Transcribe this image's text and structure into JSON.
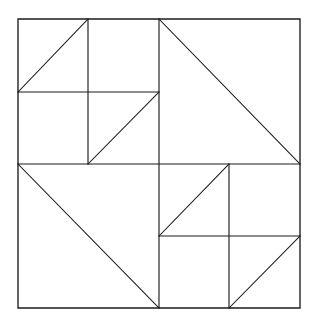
{
  "figure": {
    "type": "line-diagram",
    "background_color": "#ffffff",
    "line_color": "#1c1c1c",
    "canvas": {
      "width": 317,
      "height": 323
    },
    "square": {
      "x0": 18,
      "y0": 19,
      "x1": 300,
      "y1": 308,
      "width": 282,
      "height": 289
    },
    "center": {
      "x": 159,
      "y": 164
    },
    "outer_square": {
      "name": "outer-square",
      "points": "18,19 300,19 300,308 18,308 18,19"
    },
    "center_divider_horizontal": {
      "name": "center-horizontal-divider",
      "x1": 18,
      "y1": 164,
      "x2": 300,
      "y2": 164
    },
    "center_divider_vertical": {
      "name": "center-vertical-divider",
      "x1": 159,
      "y1": 19,
      "x2": 159,
      "y2": 308
    },
    "quadrants": [
      {
        "name": "top-left-quadrant",
        "bounds": {
          "x0": 18,
          "y0": 19,
          "x1": 159,
          "y1": 164
        },
        "subdivided": true,
        "sub_vertical": {
          "x1": 88,
          "y1": 19,
          "x2": 88,
          "y2": 164
        },
        "sub_horizontal": {
          "x1": 18,
          "y1": 92,
          "x2": 159,
          "y2": 92
        },
        "diagonals": [
          {
            "name": "diagonal-tl-cell-a",
            "x1": 18,
            "y1": 92,
            "x2": 88,
            "y2": 19
          },
          {
            "name": "diagonal-tl-cell-d",
            "x1": 88,
            "y1": 164,
            "x2": 159,
            "y2": 92
          }
        ]
      },
      {
        "name": "top-right-quadrant",
        "bounds": {
          "x0": 159,
          "y0": 19,
          "x1": 300,
          "y1": 164
        },
        "subdivided": false,
        "diagonals": [
          {
            "name": "diagonal-top-right-large",
            "x1": 159,
            "y1": 19,
            "x2": 300,
            "y2": 164
          }
        ]
      },
      {
        "name": "bottom-left-quadrant",
        "bounds": {
          "x0": 18,
          "y0": 164,
          "x1": 159,
          "y1": 308
        },
        "subdivided": false,
        "diagonals": [
          {
            "name": "diagonal-bottom-left-large",
            "x1": 18,
            "y1": 164,
            "x2": 159,
            "y2": 308
          }
        ]
      },
      {
        "name": "bottom-right-quadrant",
        "bounds": {
          "x0": 159,
          "y0": 164,
          "x1": 300,
          "y1": 308
        },
        "subdivided": true,
        "sub_vertical": {
          "x1": 229,
          "y1": 164,
          "x2": 229,
          "y2": 308
        },
        "sub_horizontal": {
          "x1": 159,
          "y1": 236,
          "x2": 300,
          "y2": 236
        },
        "diagonals": [
          {
            "name": "diagonal-br-cell-a",
            "x1": 159,
            "y1": 236,
            "x2": 229,
            "y2": 164
          },
          {
            "name": "diagonal-br-cell-d",
            "x1": 229,
            "y1": 308,
            "x2": 300,
            "y2": 236
          }
        ]
      }
    ]
  }
}
